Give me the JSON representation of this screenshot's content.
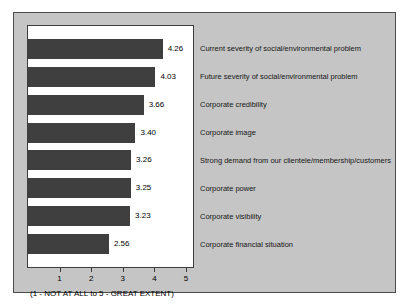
{
  "chart_data": {
    "type": "bar",
    "orientation": "horizontal",
    "title": "",
    "categories": [
      "Current severity of social/environmental problem",
      "Future severity of social/environmental problem",
      "Corporate credibility",
      "Corporate image",
      "Strong demand from our clientele/membership/customers",
      "Corporate power",
      "Corporate visibility",
      "Corporate financial situation"
    ],
    "values": [
      4.26,
      4.03,
      3.66,
      3.4,
      3.26,
      3.25,
      3.23,
      2.56
    ],
    "value_labels": [
      "4.26",
      "4.03",
      "3.66",
      "3.40",
      "3.26",
      "3.25",
      "3.23",
      "2.56"
    ],
    "x_ticks": [
      1,
      2,
      3,
      4,
      5
    ],
    "xlim": [
      0,
      5.22
    ],
    "scale_note": "(1 - NOT AT ALL to 5 - GREAT EXTENT)",
    "xlabel": "",
    "ylabel": "",
    "grid": "off",
    "legend": "none",
    "colors": {
      "bar": "#3f3f3f",
      "panel_background": "#c5c5c5",
      "plot_background": "#ffffff",
      "border": "#3d3d3d",
      "text": "#000000"
    }
  }
}
